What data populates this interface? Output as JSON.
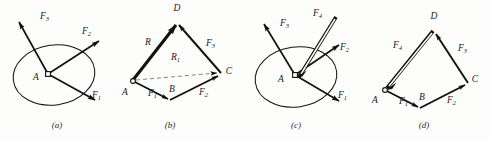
{
  "figure": {
    "width": 491,
    "height": 141,
    "background_color": "#fdfdfc",
    "ink_color": "#111111",
    "dash_color": "#6e6e6e"
  },
  "panels": [
    {
      "id": "a",
      "caption": "(a)",
      "type": "concurrent-force-diagram",
      "point_label": "A",
      "vectors": [
        {
          "name": "F",
          "subscript": "1",
          "label_x": 92,
          "label_y": 98
        },
        {
          "name": "F",
          "subscript": "2",
          "label_x": 82,
          "label_y": 34
        },
        {
          "name": "F",
          "subscript": "3",
          "label_x": 40,
          "label_y": 19
        }
      ],
      "has_body_outline": true
    },
    {
      "id": "b",
      "caption": "(b)",
      "type": "vector-polygon",
      "vertices": [
        "A",
        "B",
        "C",
        "D"
      ],
      "edges": [
        {
          "name": "F",
          "subscript": "1",
          "from": "A",
          "to": "B",
          "label_x": 148,
          "label_y": 96
        },
        {
          "name": "F",
          "subscript": "2",
          "from": "B",
          "to": "C",
          "label_x": 199,
          "label_y": 95
        },
        {
          "name": "F",
          "subscript": "3",
          "from": "C",
          "to": "D",
          "label_x": 206,
          "label_y": 46
        },
        {
          "name": "R",
          "subscript": "",
          "from": "A",
          "to": "D",
          "label_x": 145,
          "label_y": 45
        },
        {
          "name": "R",
          "subscript": "1",
          "from": "A",
          "to": "C",
          "label_x": 178,
          "label_y": 60
        }
      ],
      "resultant_is_heavy": true,
      "auxiliary_is_dashed": true
    },
    {
      "id": "c",
      "caption": "(c)",
      "type": "concurrent-force-diagram",
      "point_label": "A",
      "vectors": [
        {
          "name": "F",
          "subscript": "1",
          "label_x": 338,
          "label_y": 98
        },
        {
          "name": "F",
          "subscript": "2",
          "label_x": 340,
          "label_y": 50
        },
        {
          "name": "F",
          "subscript": "3",
          "label_x": 280,
          "label_y": 26
        },
        {
          "name": "F",
          "subscript": "4",
          "label_x": 313,
          "label_y": 16
        }
      ],
      "has_body_outline": true,
      "equilibrant_vector": "F4"
    },
    {
      "id": "d",
      "caption": "(d)",
      "type": "vector-polygon",
      "vertices": [
        "A",
        "B",
        "C",
        "D"
      ],
      "edges": [
        {
          "name": "F",
          "subscript": "1",
          "from": "A",
          "to": "B",
          "label_x": 399,
          "label_y": 104
        },
        {
          "name": "F",
          "subscript": "2",
          "from": "B",
          "to": "C",
          "label_x": 447,
          "label_y": 103
        },
        {
          "name": "F",
          "subscript": "3",
          "from": "C",
          "to": "D",
          "label_x": 458,
          "label_y": 51
        },
        {
          "name": "F",
          "subscript": "4",
          "from": "D",
          "to": "A",
          "label_x": 399,
          "label_y": 48
        }
      ],
      "closing_vector_is_hollow": true
    }
  ],
  "vertex_labels": {
    "panel_b": [
      {
        "text": "A",
        "x": 125,
        "y": 95
      },
      {
        "text": "B",
        "x": 172,
        "y": 92
      },
      {
        "text": "C",
        "x": 229,
        "y": 74
      },
      {
        "text": "D",
        "x": 177,
        "y": 11
      }
    ],
    "panel_d": [
      {
        "text": "A",
        "x": 375,
        "y": 103
      },
      {
        "text": "B",
        "x": 422,
        "y": 100
      },
      {
        "text": "C",
        "x": 475,
        "y": 82
      },
      {
        "text": "D",
        "x": 434,
        "y": 19
      }
    ]
  },
  "center_labels": [
    {
      "text": "A",
      "x": 36,
      "y": 80
    },
    {
      "text": "A",
      "x": 281,
      "y": 82
    }
  ],
  "captions": [
    {
      "text": "(a)",
      "x": 57,
      "y": 128
    },
    {
      "text": "(b)",
      "x": 170,
      "y": 128
    },
    {
      "text": "(c)",
      "x": 296,
      "y": 128
    },
    {
      "text": "(d)",
      "x": 424,
      "y": 128
    }
  ]
}
